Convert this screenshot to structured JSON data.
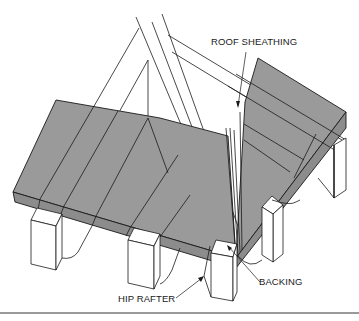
{
  "figure": {
    "type": "isometric technical line drawing"
  },
  "labels": {
    "roof_sheathing": "ROOF SHEATHING",
    "hip_rafter": "HIP RAFTER",
    "backing": "BACKING"
  },
  "colors": {
    "sheathing_fill": "#9a9a9a",
    "sheathing_edge_fill": "#888888",
    "line": "#1a1a1a",
    "background": "#ffffff",
    "rule": "#9a9a9a"
  }
}
